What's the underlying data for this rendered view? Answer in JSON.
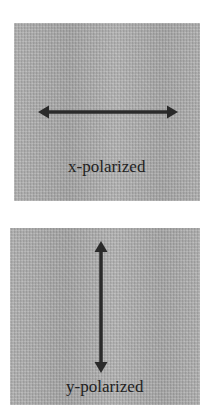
{
  "panels": [
    {
      "id": "x",
      "label": "x-polarized",
      "arrow_direction": "horizontal",
      "icon": "double-headed-horizontal-arrow"
    },
    {
      "id": "y",
      "label": "y-polarized",
      "arrow_direction": "vertical",
      "icon": "double-headed-vertical-arrow"
    }
  ],
  "colors": {
    "panel_gray": "#a9a9a9",
    "arrow": "#2a2a2a",
    "text": "#222222",
    "background": "#ffffff"
  }
}
